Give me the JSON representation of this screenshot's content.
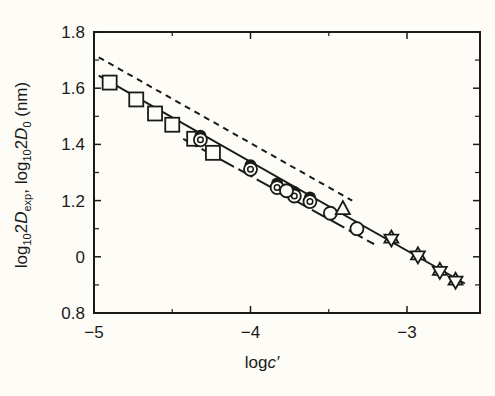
{
  "chart_data": {
    "type": "scatter",
    "title": "",
    "xlabel": "logc′",
    "ylabel": "log₁₀2D_exp, log₁₀2D₀ (nm)",
    "xlim": [
      -5,
      -2.57
    ],
    "ylim": [
      0.8,
      1.8
    ],
    "x_ticks": [
      -5,
      -4,
      -3
    ],
    "x_tick_labels": [
      "−5",
      "−4",
      "−3"
    ],
    "x_minor_ticks": [
      -4.5,
      -3.5
    ],
    "y_ticks": [
      0.8,
      1.0,
      1.2,
      1.4,
      1.6,
      1.8
    ],
    "y_tick_labels": [
      "0.8",
      "0",
      "1.2",
      "1.4",
      "1.6",
      "1.8"
    ],
    "y_minor_ticks": [
      0.9,
      1.1,
      1.3,
      1.5,
      1.7
    ],
    "grid": false,
    "legend": null,
    "lines": [
      {
        "name": "dashed (log10 2D0)",
        "style": "short-dash",
        "points": [
          [
            -4.97,
            1.71
          ],
          [
            -3.35,
            1.2
          ]
        ]
      },
      {
        "name": "solid fit",
        "style": "solid",
        "points": [
          [
            -4.97,
            1.645
          ],
          [
            -2.63,
            0.905
          ]
        ]
      },
      {
        "name": "long-dash fit",
        "style": "long-dash",
        "points": [
          [
            -4.43,
            1.42
          ],
          [
            -3.21,
            1.045
          ]
        ]
      }
    ],
    "series": [
      {
        "name": "squares",
        "marker": "square",
        "x": [
          -4.9,
          -4.73,
          -4.61,
          -4.5,
          -4.36,
          -4.24
        ],
        "y": [
          1.62,
          1.56,
          1.51,
          1.47,
          1.42,
          1.37
        ]
      },
      {
        "name": "dotted circles",
        "marker": "dotted-circle",
        "x": [
          -4.32,
          -4.0,
          -3.83,
          -3.72,
          -3.62
        ],
        "y": [
          1.42,
          1.315,
          1.25,
          1.22,
          1.2
        ]
      },
      {
        "name": "open circles",
        "marker": "circle",
        "x": [
          -3.77,
          -3.49,
          -3.32
        ],
        "y": [
          1.235,
          1.155,
          1.1
        ]
      },
      {
        "name": "triangle",
        "marker": "triangle",
        "x": [
          -3.41
        ],
        "y": [
          1.17
        ]
      },
      {
        "name": "stars",
        "marker": "star",
        "x": [
          -3.1,
          -2.93,
          -2.79,
          -2.69
        ],
        "y": [
          1.065,
          1.005,
          0.95,
          0.915
        ]
      }
    ]
  },
  "labels": {
    "xlabel_main": "log",
    "xlabel_var": "c′",
    "ylabel_parts": {
      "a": "log",
      "a_sub": "10",
      "b": "2",
      "c": "D",
      "c_sub": "exp",
      "sep": ", log",
      "d_sub": "10",
      "e": "2",
      "f": "D",
      "f_sub": "0",
      "unit": " (nm)"
    }
  }
}
